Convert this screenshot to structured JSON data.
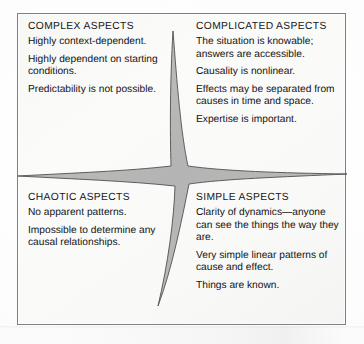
{
  "figure": {
    "kind": "four-quadrant-aspects-matrix",
    "frame_border_color": "#7d7f80",
    "paper_color": "#f8f8f7",
    "star_fill_color": "#b9b9b9",
    "star_stroke_color": "#4a4a4a",
    "ink_color": "#121314"
  },
  "quadrants": {
    "complex": {
      "title": "COMPLEX ASPECTS",
      "paragraphs": [
        "Highly context-dependent.",
        "Highly dependent on starting conditions.",
        "Predictability is not possible."
      ]
    },
    "complicated": {
      "title": "COMPLICATED ASPECTS",
      "paragraphs": [
        "The situation is knowable; answers are accessible.",
        "Causality is nonlinear.",
        "Effects may be separated from causes in time and space.",
        "Expertise is important."
      ]
    },
    "chaotic": {
      "title": "CHAOTIC ASPECTS",
      "paragraphs": [
        "No apparent patterns.",
        "Impossible to determine any causal relationships."
      ]
    },
    "simple": {
      "title": "SIMPLE ASPECTS",
      "paragraphs": [
        "Clarity of dynamics—anyone can see the things the way they are.",
        "Very simple linear patterns of cause and effect.",
        "Things are known."
      ]
    }
  }
}
